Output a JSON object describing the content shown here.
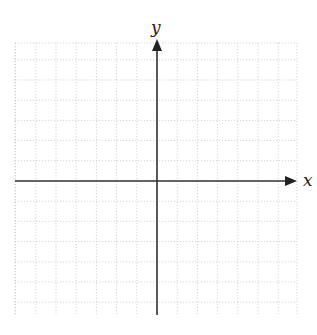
{
  "diagram": {
    "type": "coordinate-plane",
    "x_axis_label": "x",
    "y_axis_label": "y",
    "grid": {
      "left": 15,
      "top": 43,
      "right": 297,
      "bottom": 315,
      "cell_size": 20.2,
      "columns": 14,
      "rows": 13.5,
      "line_style": "dotted",
      "line_color": "#c8c8c8"
    },
    "origin": {
      "x": 157,
      "y": 181
    },
    "axis_color": "#333333",
    "tick_labels": []
  }
}
